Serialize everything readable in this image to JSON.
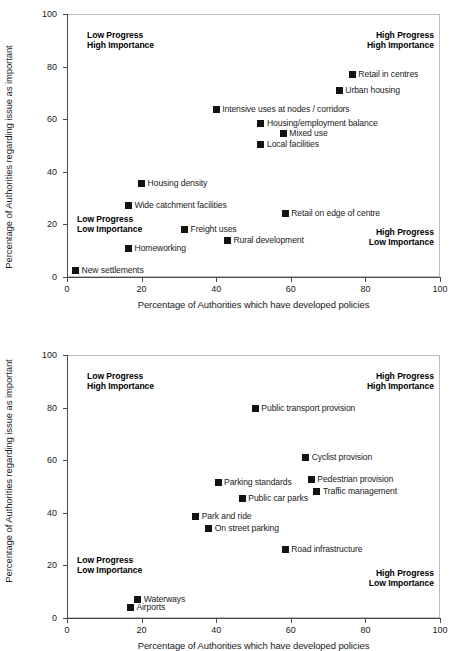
{
  "axes": {
    "ylabel": "Percentage of Authorities regarding issue as important",
    "xlabel": "Percentage of Authorities which have developed policies",
    "yticks": [
      "0",
      "20",
      "40",
      "60",
      "80",
      "100"
    ],
    "xticks": [
      "0",
      "20",
      "40",
      "60",
      "80",
      "100"
    ]
  },
  "quadrants": {
    "top_left": "Low Progress\nHigh Importance",
    "top_right": "High Progress\nHigh Importance",
    "bottom_left": "Low Progress\nLow Importance",
    "bottom_right": "High Progress\nLow Importance"
  },
  "chart_data": [
    {
      "type": "scatter",
      "title": "",
      "xlabel": "Percentage of Authorities which have developed policies",
      "ylabel": "Percentage of Authorities regarding issue as important",
      "xlim": [
        0,
        100
      ],
      "ylim": [
        0,
        100
      ],
      "xticks": [
        0,
        20,
        40,
        60,
        80,
        100
      ],
      "yticks": [
        0,
        20,
        40,
        60,
        80,
        100
      ],
      "grid": false,
      "legend": "none",
      "annotations": [
        "Low Progress / High Importance",
        "High Progress / High Importance",
        "Low Progress / Low Importance",
        "High Progress / Low Importance"
      ],
      "points": [
        {
          "label": "Retail in centres",
          "x": 76.5,
          "y": 77,
          "side": "right"
        },
        {
          "label": "Urban housing",
          "x": 73,
          "y": 71,
          "side": "right"
        },
        {
          "label": "Intensive uses at nodes / corridors",
          "x": 40,
          "y": 63.5,
          "side": "right"
        },
        {
          "label": "Housing/employment balance",
          "x": 52,
          "y": 58.5,
          "side": "right"
        },
        {
          "label": "Mixed use",
          "x": 58,
          "y": 54.5,
          "side": "right"
        },
        {
          "label": "Local facilities",
          "x": 52,
          "y": 50.5,
          "side": "right"
        },
        {
          "label": "Housing density",
          "x": 20,
          "y": 35.5,
          "side": "right"
        },
        {
          "label": "Wide catchment facilities",
          "x": 16.5,
          "y": 27,
          "side": "right"
        },
        {
          "label": "Retail on edge of centre",
          "x": 58.5,
          "y": 24,
          "side": "right"
        },
        {
          "label": "Freight uses",
          "x": 31.5,
          "y": 18,
          "side": "right"
        },
        {
          "label": "Rural development",
          "x": 43,
          "y": 14,
          "side": "right"
        },
        {
          "label": "Homeworking",
          "x": 16.5,
          "y": 11,
          "side": "right"
        },
        {
          "label": "New settlements",
          "x": 2.3,
          "y": 2.5,
          "side": "right"
        }
      ]
    },
    {
      "type": "scatter",
      "title": "",
      "xlabel": "Percentage of Authorities which have developed policies",
      "ylabel": "Percentage of Authorities regarding issue as important",
      "xlim": [
        0,
        100
      ],
      "ylim": [
        0,
        100
      ],
      "xticks": [
        0,
        20,
        40,
        60,
        80,
        100
      ],
      "yticks": [
        0,
        20,
        40,
        60,
        80,
        100
      ],
      "grid": false,
      "legend": "none",
      "annotations": [
        "Low Progress / High Importance",
        "High Progress / High Importance",
        "Low Progress / Low Importance",
        "High Progress / Low Importance"
      ],
      "points": [
        {
          "label": "Public transport provision",
          "x": 50.5,
          "y": 79.5,
          "side": "right"
        },
        {
          "label": "Cyclist provision",
          "x": 64,
          "y": 61,
          "side": "right"
        },
        {
          "label": "Pedestrian provision",
          "x": 65.5,
          "y": 52.5,
          "side": "right"
        },
        {
          "label": "Parking standards",
          "x": 40.5,
          "y": 51.5,
          "side": "right"
        },
        {
          "label": "Traffic management",
          "x": 67,
          "y": 48,
          "side": "right"
        },
        {
          "label": "Public car parks",
          "x": 47,
          "y": 45.5,
          "side": "right"
        },
        {
          "label": "Park and ride",
          "x": 34.5,
          "y": 38.5,
          "side": "right"
        },
        {
          "label": "On street parking",
          "x": 38,
          "y": 34,
          "side": "right"
        },
        {
          "label": "Road infrastructure",
          "x": 58.5,
          "y": 26,
          "side": "right"
        },
        {
          "label": "Waterways",
          "x": 19,
          "y": 7,
          "side": "right"
        },
        {
          "label": "Airports",
          "x": 17,
          "y": 4,
          "side": "right"
        }
      ]
    }
  ]
}
